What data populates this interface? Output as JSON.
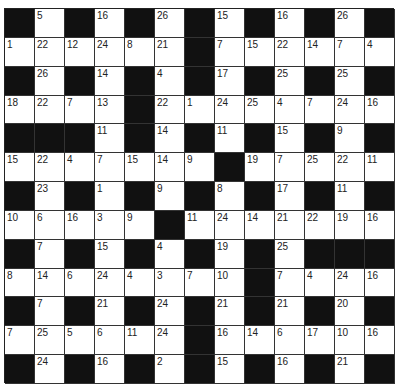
{
  "puzzle": {
    "type": "codeword",
    "rows": 13,
    "cols": 13,
    "colors": {
      "block": "#111111",
      "cell": "#ffffff",
      "text": "#222222"
    },
    "grid": [
      [
        null,
        5,
        null,
        16,
        null,
        26,
        null,
        15,
        null,
        16,
        null,
        26,
        null
      ],
      [
        1,
        22,
        12,
        24,
        8,
        21,
        null,
        7,
        15,
        22,
        14,
        7,
        4
      ],
      [
        null,
        26,
        null,
        14,
        null,
        4,
        null,
        17,
        null,
        25,
        null,
        25,
        null
      ],
      [
        18,
        22,
        7,
        13,
        null,
        22,
        1,
        24,
        25,
        4,
        7,
        24,
        16
      ],
      [
        null,
        null,
        null,
        11,
        null,
        14,
        null,
        11,
        null,
        15,
        null,
        9,
        null
      ],
      [
        15,
        22,
        4,
        7,
        15,
        14,
        9,
        null,
        19,
        7,
        25,
        22,
        11
      ],
      [
        null,
        23,
        null,
        1,
        null,
        9,
        null,
        8,
        null,
        17,
        null,
        11,
        null
      ],
      [
        10,
        6,
        16,
        3,
        9,
        null,
        11,
        24,
        14,
        21,
        22,
        19,
        16
      ],
      [
        null,
        7,
        null,
        15,
        null,
        4,
        null,
        19,
        null,
        25,
        null,
        null,
        null
      ],
      [
        8,
        14,
        6,
        24,
        4,
        3,
        7,
        10,
        null,
        7,
        4,
        24,
        16
      ],
      [
        null,
        7,
        null,
        21,
        null,
        24,
        null,
        21,
        null,
        21,
        null,
        20,
        null
      ],
      [
        7,
        25,
        5,
        6,
        11,
        24,
        null,
        16,
        14,
        6,
        17,
        10,
        16
      ],
      [
        null,
        24,
        null,
        16,
        null,
        2,
        null,
        15,
        null,
        16,
        null,
        21,
        null
      ]
    ]
  }
}
